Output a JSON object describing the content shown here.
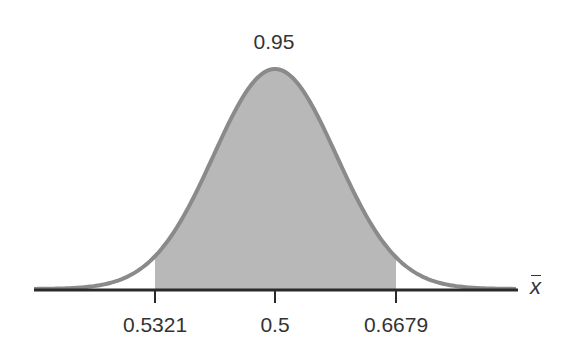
{
  "chart_data": {
    "type": "area",
    "title": "",
    "xlabel": "x̄",
    "ylabel": "",
    "distribution": {
      "mean": 0.5,
      "shape": "normal"
    },
    "shaded_region": {
      "from": 0.5321,
      "to": 0.6679,
      "area": 0.95
    },
    "tick_labels": [
      "0.5321",
      "0.5",
      "0.6679"
    ],
    "annotations": [
      {
        "text": "0.95",
        "position": "above peak"
      }
    ],
    "grid": false,
    "legend": null
  },
  "labels": {
    "area": "0.95",
    "tick_left": "0.5321",
    "tick_center": "0.5",
    "tick_right": "0.6679",
    "axis": "x"
  },
  "colors": {
    "curve": "#8a8a8a",
    "fill": "#b8b8b8",
    "axis": "#2a2a2a",
    "text": "#333333"
  }
}
